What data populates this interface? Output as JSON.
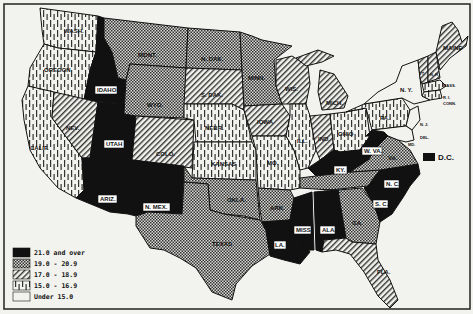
{
  "map": {
    "type": "choropleth",
    "region": "United States",
    "legend": [
      {
        "key": "c5",
        "label": "21.0 and over",
        "pattern": "solid-black"
      },
      {
        "key": "c4",
        "label": "19.0 - 20.9",
        "pattern": "crosshatch"
      },
      {
        "key": "c3",
        "label": "17.0 - 18.9",
        "pattern": "diagonal-lines"
      },
      {
        "key": "c2",
        "label": "15.0 - 16.9",
        "pattern": "vertical-dashes"
      },
      {
        "key": "c1",
        "label": "Under 15.0",
        "pattern": "blank"
      }
    ],
    "dc": {
      "label": "D.C.",
      "category": "c5"
    },
    "states": [
      {
        "abbr": "WASH.",
        "category": "c2"
      },
      {
        "abbr": "OREGON",
        "category": "c2"
      },
      {
        "abbr": "CALIF.",
        "category": "c2"
      },
      {
        "abbr": "IDAHO",
        "category": "c5"
      },
      {
        "abbr": "NEV.",
        "category": "c3"
      },
      {
        "abbr": "UTAH",
        "category": "c5"
      },
      {
        "abbr": "ARIZ.",
        "category": "c5"
      },
      {
        "abbr": "MONT.",
        "category": "c4"
      },
      {
        "abbr": "WYO.",
        "category": "c4"
      },
      {
        "abbr": "COLO.",
        "category": "c3"
      },
      {
        "abbr": "N. MEX.",
        "category": "c5"
      },
      {
        "abbr": "N. DAK.",
        "category": "c4"
      },
      {
        "abbr": "S. DAK.",
        "category": "c3"
      },
      {
        "abbr": "NEBR.",
        "category": "c2"
      },
      {
        "abbr": "KANSAS",
        "category": "c2"
      },
      {
        "abbr": "OKLA.",
        "category": "c4"
      },
      {
        "abbr": "TEXAS",
        "category": "c4"
      },
      {
        "abbr": "MINN.",
        "category": "c4"
      },
      {
        "abbr": "IOWA",
        "category": "c3"
      },
      {
        "abbr": "MO.",
        "category": "c2"
      },
      {
        "abbr": "ARK.",
        "category": "c4"
      },
      {
        "abbr": "LA.",
        "category": "c5"
      },
      {
        "abbr": "WIS.",
        "category": "c3"
      },
      {
        "abbr": "ILL.",
        "category": "c2"
      },
      {
        "abbr": "MICH.",
        "category": "c3"
      },
      {
        "abbr": "IND.",
        "category": "c3"
      },
      {
        "abbr": "OHIO",
        "category": "c2"
      },
      {
        "abbr": "KY.",
        "category": "c5"
      },
      {
        "abbr": "TENN.",
        "category": "c4"
      },
      {
        "abbr": "MISS.",
        "category": "c5"
      },
      {
        "abbr": "ALA.",
        "category": "c5"
      },
      {
        "abbr": "GA.",
        "category": "c4"
      },
      {
        "abbr": "FLA.",
        "category": "c3"
      },
      {
        "abbr": "S. C.",
        "category": "c5"
      },
      {
        "abbr": "N. C.",
        "category": "c5"
      },
      {
        "abbr": "VA.",
        "category": "c4"
      },
      {
        "abbr": "W. VA.",
        "category": "c5"
      },
      {
        "abbr": "PA.",
        "category": "c2"
      },
      {
        "abbr": "N. Y.",
        "category": "c1"
      },
      {
        "abbr": "VT.",
        "category": "c3"
      },
      {
        "abbr": "N. H.",
        "category": "c3"
      },
      {
        "abbr": "MAINE",
        "category": "c3"
      },
      {
        "abbr": "MASS.",
        "category": "c2"
      },
      {
        "abbr": "R. I.",
        "category": "c2"
      },
      {
        "abbr": "CONN.",
        "category": "c2"
      },
      {
        "abbr": "N. J.",
        "category": "c1"
      },
      {
        "abbr": "DEL.",
        "category": "c1"
      },
      {
        "abbr": "MD.",
        "category": "c1"
      }
    ]
  }
}
